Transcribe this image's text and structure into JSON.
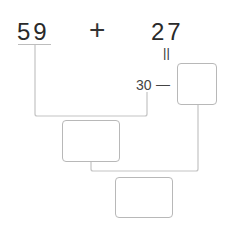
{
  "problem": {
    "left_operand": "59",
    "operator": "+",
    "right_operand": "27",
    "equals_vertical": "||",
    "decomposition_part": "30",
    "dash": "—"
  },
  "boxes": [
    {
      "name": "decomposition-box",
      "value": ""
    },
    {
      "name": "intermediate-sum-box",
      "value": ""
    },
    {
      "name": "final-answer-box",
      "value": ""
    }
  ],
  "colors": {
    "line": "#c4c4c4",
    "box_border": "#b8b8b8",
    "text": "#2a2a2a"
  }
}
